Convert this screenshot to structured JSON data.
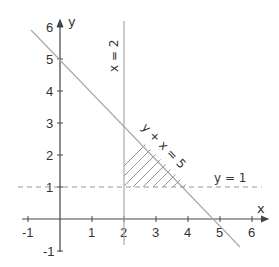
{
  "diagram": {
    "type": "linear-inequality-region",
    "axes": {
      "x_label": "x",
      "y_label": "y",
      "x_ticks": [
        "-1",
        "1",
        "2",
        "3",
        "4",
        "5",
        "6"
      ],
      "y_ticks": [
        "-1",
        "1",
        "2",
        "3",
        "4",
        "5",
        "6"
      ]
    },
    "lines": {
      "vertical": {
        "label": "x = 2",
        "equation": "x = 2"
      },
      "diagonal": {
        "label": "y + x = 5",
        "equation": "y + x = 5"
      },
      "horizontal": {
        "label": "y = 1",
        "equation": "y = 1",
        "style": "dashed"
      }
    },
    "shaded_region": {
      "description": "triangle bounded by x = 2, y = 1, y + x = 5",
      "vertices": [
        [
          2,
          1
        ],
        [
          2,
          3
        ],
        [
          4,
          1
        ]
      ],
      "fill": "hatched"
    },
    "colors": {
      "axis": "#444444",
      "line": "#aaaaaa",
      "text": "#333333",
      "hatch": "#777777"
    }
  }
}
